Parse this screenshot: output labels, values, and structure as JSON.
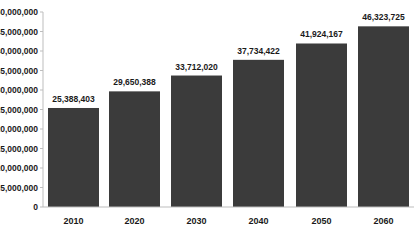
{
  "chart_data": {
    "type": "bar",
    "title": "",
    "xlabel": "",
    "ylabel": "",
    "categories": [
      "2010",
      "2020",
      "2030",
      "2040",
      "2050",
      "2060"
    ],
    "values": [
      25388403,
      29650388,
      33712020,
      37734422,
      41924167,
      46323725
    ],
    "value_labels": [
      "25,388,403",
      "29,650,388",
      "33,712,020",
      "37,734,422",
      "41,924,167",
      "46,323,725"
    ],
    "ylim": [
      0,
      50000000
    ],
    "yticks": [
      0,
      5000000,
      10000000,
      15000000,
      20000000,
      25000000,
      30000000,
      35000000,
      40000000,
      45000000,
      50000000
    ],
    "ytick_labels": [
      "0",
      "5,000,000",
      "10,000,000",
      "15,000,000",
      "20,000,000",
      "25,000,000",
      "30,000,000",
      "35,000,000",
      "40,000,000",
      "45,000,000",
      "50,000,000"
    ],
    "grid": false,
    "legend": null,
    "colors": {
      "bar": "#3b3b3b",
      "axis": "#bdbdbd",
      "text": "#1a1a1a"
    }
  }
}
